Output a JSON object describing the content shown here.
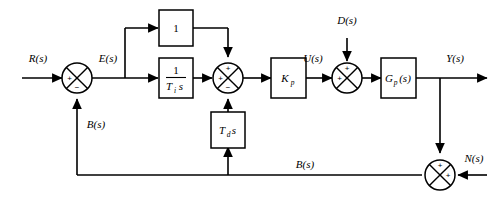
{
  "diagram": {
    "type": "control-system-block-diagram",
    "colors": {
      "line": "#000000",
      "background": "#ffffff",
      "block_fill": "#ffffff"
    },
    "signals": {
      "reference": "R(s)",
      "error": "E(s)",
      "feedback_left": "B(s)",
      "feedback_bottom": "B(s)",
      "control": "U(s)",
      "disturbance": "D(s)",
      "output": "Y(s)",
      "noise": "N(s)"
    },
    "blocks": {
      "proportional_unity": "1",
      "integral_numerator": "1",
      "integral_denominator_T": "T",
      "integral_denominator_sub": "i",
      "integral_denominator_s": "s",
      "derivative_T": "T",
      "derivative_sub": "d",
      "derivative_s": "s",
      "gain_K": "K",
      "gain_sub": "p",
      "plant_G": "G",
      "plant_sub": "p",
      "plant_arg": "(s)"
    },
    "summing_junctions": [
      {
        "name": "error-junction",
        "signs": {
          "left": "+",
          "bottom": "−"
        }
      },
      {
        "name": "pid-sum-junction",
        "signs": {
          "top": "+",
          "left": "+",
          "bottom": "−"
        }
      },
      {
        "name": "disturbance-junction",
        "signs": {
          "top": "+",
          "left": "+"
        }
      },
      {
        "name": "noise-junction",
        "signs": {
          "top": "+",
          "right": "+"
        }
      }
    ],
    "signs": {
      "plus": "+",
      "minus": "−"
    }
  }
}
